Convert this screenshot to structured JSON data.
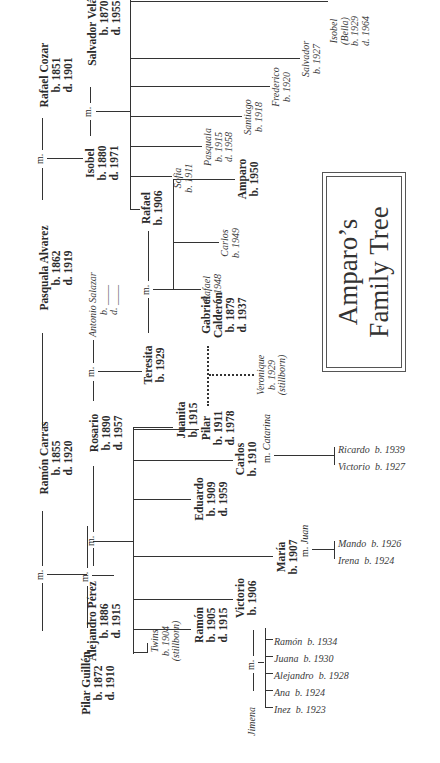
{
  "title": {
    "line1": "Amparo’s",
    "line2": "Family Tree"
  },
  "marriage_label": "m.",
  "gen1": {
    "pilar_guillen": {
      "name": "Pilar Guillén",
      "b": "b. 1872",
      "d": "d. 1910"
    },
    "ramon_carras": {
      "name": "Ramón Carras",
      "b": "b. 1855",
      "d": "d. 1920"
    },
    "pasquala_alvarez": {
      "name": "Pasquala Alvarez",
      "b": "b. 1862",
      "d": "d. 1919"
    },
    "rafael_cozar": {
      "name": "Rafael Cozar",
      "b": "b. 1851",
      "d": "d. 1901"
    }
  },
  "gen2": {
    "alejandro_perez": {
      "name": "Alejandro Pérez",
      "b": "b. 1886",
      "d": "d. 1915"
    },
    "rosario": {
      "name": "Rosario",
      "b": "b. 1890",
      "d": "d. 1957"
    },
    "antonio_salazar": {
      "name": "Antonio Salazar",
      "b": "b. ____",
      "d": "d. ____"
    },
    "isobel": {
      "name": "Isobel",
      "b": "b. 1880",
      "d": "d. 1971"
    },
    "salvador_velasquez": {
      "name": "Salvador Velásquez",
      "b": "b. 1870",
      "d": "d. 1955"
    }
  },
  "perez_children": {
    "twins": {
      "name": "Twins",
      "b": "b. 1904",
      "note": "(stillborn)"
    },
    "ramon": {
      "name": "Ramón",
      "b": "b. 1905",
      "d": "d. 1915"
    },
    "victorio": {
      "name": "Victorio",
      "b": "b. 1906"
    },
    "maria": {
      "name": "María",
      "b": "b. 1907"
    },
    "eduardo": {
      "name": "Eduardo",
      "b": "b. 1909",
      "d": "d. 1959"
    },
    "carlos": {
      "name": "Carlos",
      "b": "b. 1910"
    },
    "pilar": {
      "name": "Pilar",
      "b": "b. 1911",
      "d": "d. 1978"
    },
    "juanita": {
      "name": "Juanita",
      "b": "b. 1915"
    }
  },
  "teresita": {
    "name": "Teresita",
    "b": "b. 1929"
  },
  "gabriel_calderon": {
    "name1": "Gabriel",
    "name2": "Calderón",
    "b": "b. 1879",
    "d": "d. 1937"
  },
  "veronique": {
    "name": "Veronique",
    "b": "b. 1929",
    "note": "(stillborn)"
  },
  "victorio_family": {
    "spouse": "Jimena",
    "children": [
      {
        "name": "Ramón",
        "b": "b. 1934"
      },
      {
        "name": "Juana",
        "b": "b. 1930"
      },
      {
        "name": "Alejandro",
        "b": "b. 1928"
      },
      {
        "name": "Ana",
        "b": "b. 1924"
      },
      {
        "name": "Inez",
        "b": "b. 1923"
      }
    ]
  },
  "maria_family": {
    "spouse": "Juan",
    "children": [
      {
        "name": "Mando",
        "b": "b. 1926"
      },
      {
        "name": "Irena",
        "b": "b. 1924"
      }
    ]
  },
  "carlos_family": {
    "spouse": "Catarina",
    "children": [
      {
        "name": "Ricardo",
        "b": "b. 1939"
      },
      {
        "name": "Victorio",
        "b": "b. 1927"
      }
    ]
  },
  "velasquez_children": {
    "rafael": {
      "name": "Rafael",
      "b": "b. 1906"
    },
    "sofia": {
      "name": "Sofia",
      "b": "b. 1911"
    },
    "pasquala": {
      "name": "Pasquala",
      "b": "b. 1915",
      "d": "d. 1958"
    },
    "santiago": {
      "name": "Santiago",
      "b": "b. 1918"
    },
    "frederico": {
      "name": "Frederico",
      "b": "b. 1920"
    },
    "salvador": {
      "name": "Salvador",
      "b": "b. 1927"
    },
    "isobel": {
      "name": "Isobel",
      "nick": "(Bella)",
      "b": "b. 1929",
      "d": "d. 1964"
    }
  },
  "rafael_teresita_children": {
    "rafael": {
      "name": "Rafael",
      "b": "b. 1948"
    },
    "carlos": {
      "name": "Carlos",
      "b": "b. 1949"
    },
    "amparo": {
      "name": "Amparo",
      "b": "b. 1950"
    }
  }
}
